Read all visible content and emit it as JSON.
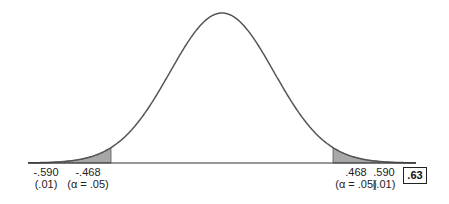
{
  "chart_data": {
    "type": "area",
    "title": "",
    "xlabel": "",
    "ylabel": "",
    "distribution": "normal",
    "critical_values": [
      {
        "value": "-.590",
        "alpha": "(.01)",
        "side": "left",
        "shade": "light"
      },
      {
        "value": "-.468",
        "alpha": "(α = .05)",
        "side": "left",
        "shade": "dark"
      },
      {
        "value": ".468",
        "alpha": "(α = .05)",
        "side": "right",
        "shade": "dark"
      },
      {
        "value": ".590",
        "alpha": "(.01)",
        "side": "right",
        "shade": "light"
      }
    ],
    "observed_value": ".63",
    "colors": {
      "curve": "#555555",
      "dark_shade": "#a8a8a8",
      "light_shade": "#dcdcdc",
      "axis": "#333333"
    }
  },
  "labels": {
    "l590": "-.590",
    "l590a": "(.01)",
    "l468": "-.468",
    "l468a": "(α = .05)",
    "r468": ".468",
    "r468a": "(α = .05)",
    "r590": ".590",
    "r590a": "(.01)",
    "box": ".63"
  }
}
